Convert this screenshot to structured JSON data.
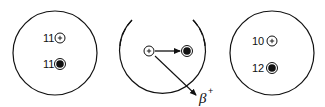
{
  "diagram": {
    "colors": {
      "stroke": "#111111",
      "background": "#ffffff"
    },
    "nuclei": [
      {
        "id": "before",
        "protons_label": "11",
        "neutrons_label": "11",
        "proton_icon": "proton-plus-icon",
        "neutron_icon": "neutron-filled-icon"
      },
      {
        "id": "transition",
        "proton_icon": "proton-plus-icon",
        "neutron_icon": "neutron-filled-icon",
        "emission_label": "β",
        "emission_sup": "+"
      },
      {
        "id": "after",
        "protons_label": "10",
        "neutrons_label": "12",
        "proton_icon": "proton-plus-icon",
        "neutron_icon": "neutron-filled-icon"
      }
    ]
  }
}
